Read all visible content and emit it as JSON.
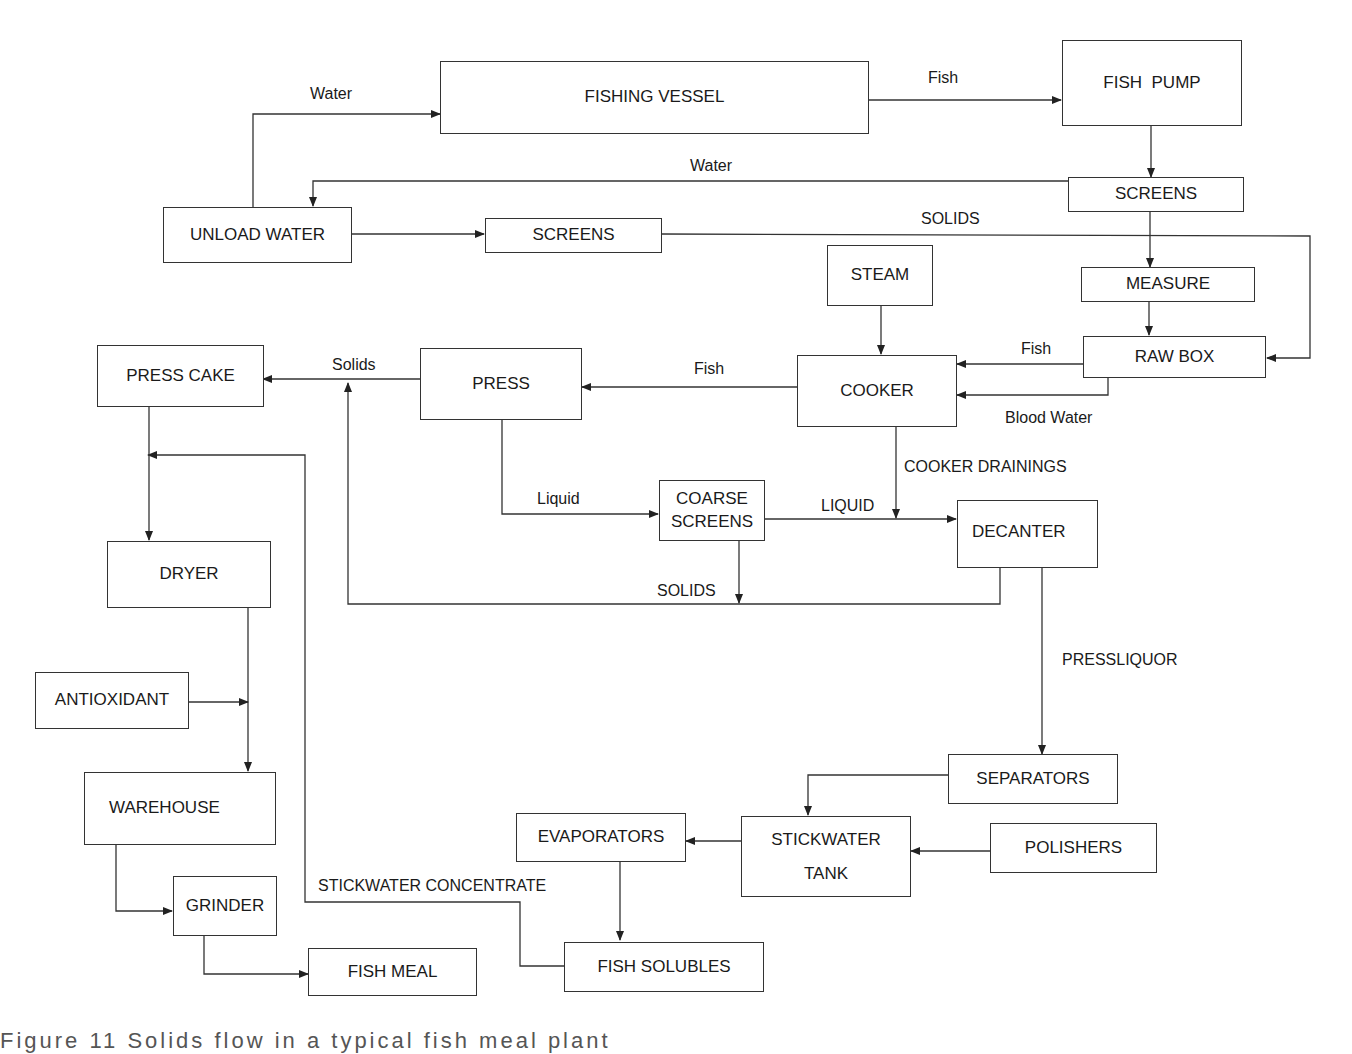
{
  "diagram": {
    "type": "process-flow",
    "nodes": {
      "fishing_vessel": "FISHING VESSEL",
      "fish_pump": "FISH  PUMP",
      "screens_top": "SCREENS",
      "unload_water": "UNLOAD WATER",
      "screens_mid": "SCREENS",
      "measure": "MEASURE",
      "steam": "STEAM",
      "raw_box": "RAW BOX",
      "press_cake": "PRESS CAKE",
      "press": "PRESS",
      "cooker": "COOKER",
      "coarse_screens_1": "COARSE",
      "coarse_screens_2": "SCREENS",
      "decanter": "DECANTER",
      "dryer": "DRYER",
      "antioxidant": "ANTIOXIDANT",
      "warehouse": "WAREHOUSE",
      "grinder": "GRINDER",
      "fish_meal": "FISH MEAL",
      "separators": "SEPARATORS",
      "evaporators": "EVAPORATORS",
      "stickwater_tank_1": "STICKWATER",
      "stickwater_tank_2": "TANK",
      "polishers": "POLISHERS",
      "fish_solubles": "FISH SOLUBLES"
    },
    "edge_labels": {
      "water_to_vessel": "Water",
      "fish_to_pump": "Fish",
      "water_to_unload": "Water",
      "solids_to_rawbox": "SOLIDS",
      "fish_rawbox_to_cooker": "Fish",
      "blood_water": "Blood Water",
      "fish_cooker_to_press": "Fish",
      "solids_press_to_cake": "Solids",
      "cooker_drainings": "COOKER DRAININGS",
      "liquid_press": "Liquid",
      "liquid_coarse": "LIQUID",
      "solids_coarse": "SOLIDS",
      "pressliquor": "PRESSLIQUOR",
      "stickwater_concentrate": "STICKWATER CONCENTRATE"
    },
    "edges": [
      [
        "unload_water",
        "fishing_vessel",
        "Water"
      ],
      [
        "fishing_vessel",
        "fish_pump",
        "Fish"
      ],
      [
        "fish_pump",
        "screens_top",
        ""
      ],
      [
        "screens_top",
        "unload_water",
        "Water"
      ],
      [
        "unload_water",
        "screens_mid",
        ""
      ],
      [
        "screens_mid",
        "raw_box",
        "SOLIDS"
      ],
      [
        "screens_top",
        "measure",
        ""
      ],
      [
        "measure",
        "raw_box",
        ""
      ],
      [
        "steam",
        "cooker",
        ""
      ],
      [
        "raw_box",
        "cooker",
        "Fish"
      ],
      [
        "raw_box",
        "cooker",
        "Blood Water"
      ],
      [
        "cooker",
        "press",
        "Fish"
      ],
      [
        "press",
        "press_cake",
        "Solids"
      ],
      [
        "press",
        "coarse_screens",
        "Liquid"
      ],
      [
        "coarse_screens",
        "decanter",
        "LIQUID"
      ],
      [
        "cooker",
        "decanter",
        "COOKER DRAININGS"
      ],
      [
        "coarse_screens",
        "press_cake",
        "SOLIDS"
      ],
      [
        "decanter",
        "press_cake",
        "SOLIDS"
      ],
      [
        "decanter",
        "separators",
        "PRESSLIQUOR"
      ],
      [
        "separators",
        "stickwater_tank",
        ""
      ],
      [
        "polishers",
        "stickwater_tank",
        ""
      ],
      [
        "stickwater_tank",
        "evaporators",
        ""
      ],
      [
        "evaporators",
        "fish_solubles",
        ""
      ],
      [
        "fish_solubles",
        "dryer",
        "STICKWATER CONCENTRATE"
      ],
      [
        "press_cake",
        "dryer",
        ""
      ],
      [
        "dryer",
        "warehouse",
        ""
      ],
      [
        "antioxidant",
        "warehouse",
        ""
      ],
      [
        "warehouse",
        "grinder",
        ""
      ],
      [
        "grinder",
        "fish_meal",
        ""
      ]
    ]
  },
  "caption": "Figure 11  Solids flow in a typical fish meal plant"
}
